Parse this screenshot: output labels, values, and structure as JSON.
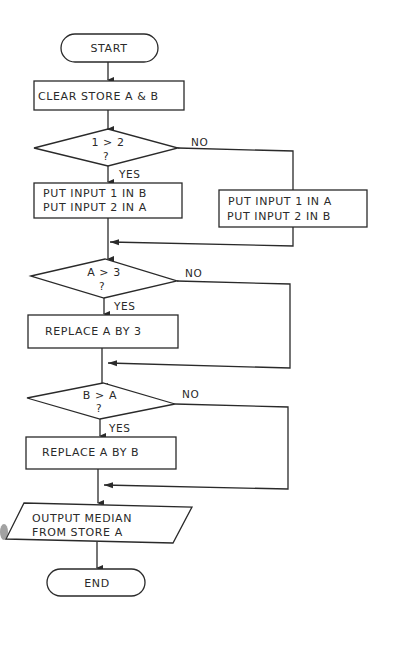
{
  "flowchart": {
    "start": "START",
    "clear": "CLEAR STORE A & B",
    "decision1": {
      "line1": "1 > 2",
      "line2": "?",
      "yes": "YES",
      "no": "NO"
    },
    "yes1_box": {
      "line1": "PUT  INPUT  1  IN  B",
      "line2": "PUT  INPUT  2  IN  A"
    },
    "no1_box": {
      "line1": "PUT  INPUT  1  IN  A",
      "line2": "PUT  INPUT  2  IN  B"
    },
    "decision2": {
      "line1": "A > 3",
      "line2": "?",
      "yes": "YES",
      "no": "NO"
    },
    "replace1": "REPLACE  A  BY  3",
    "decision3": {
      "line1": "B > A",
      "line2": "?",
      "yes": "YES",
      "no": "NO"
    },
    "replace2": "REPLACE  A  BY  B",
    "output": {
      "line1": "OUTPUT  MEDIAN",
      "line2": "FROM  STORE  A"
    },
    "end": "END"
  },
  "colors": {
    "ink": "#2a2a2a",
    "paper": "#ffffff"
  }
}
